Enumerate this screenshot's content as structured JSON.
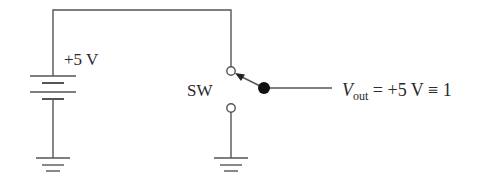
{
  "diagram": {
    "type": "circuit-schematic",
    "labels": {
      "supply": "+5 V",
      "switch": "SW",
      "output_var": "V",
      "output_sub": "out",
      "output_expr": " = +5 V ≡ 1"
    },
    "components": [
      {
        "id": "battery",
        "kind": "dc-source",
        "value": "+5 V"
      },
      {
        "id": "switch",
        "kind": "spdt-switch",
        "label": "SW",
        "position": "up"
      },
      {
        "id": "ground-left",
        "kind": "ground"
      },
      {
        "id": "ground-right",
        "kind": "ground"
      },
      {
        "id": "output-node",
        "kind": "output-terminal"
      }
    ],
    "colors": {
      "line": "#555555",
      "text": "#2a2a2a",
      "background": "#ffffff"
    }
  }
}
